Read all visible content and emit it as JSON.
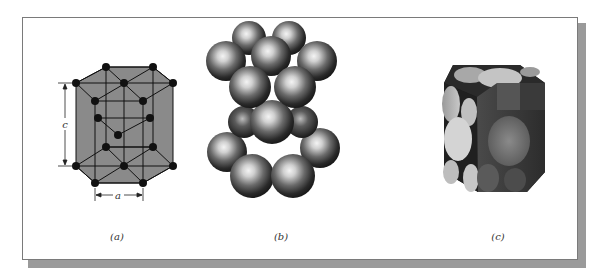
{
  "figure": {
    "panels": [
      {
        "id": "a",
        "label": "(a)",
        "description": "reduced-sphere unit cell",
        "dimension_labels": {
          "height": "c",
          "width": "a"
        }
      },
      {
        "id": "b",
        "label": "(b)",
        "description": "aggregate of many atoms (hard spheres)"
      },
      {
        "id": "c",
        "label": "(c)",
        "description": "unit cell section with sphere cuts"
      }
    ]
  },
  "colors": {
    "background": "#ffffff",
    "frame_border": "#7a7a7a",
    "frame_shadow": "#9a9a9a",
    "prism_fill": "#8a8a8a",
    "atom": "#111111",
    "sphere_dark": "#1e1e1e",
    "sphere_highlight": "#f4f4f4"
  }
}
